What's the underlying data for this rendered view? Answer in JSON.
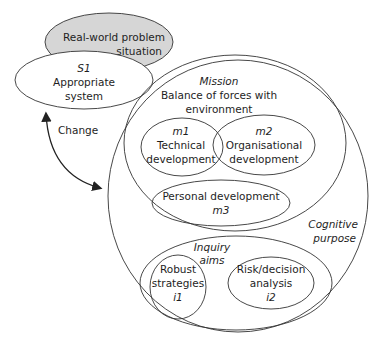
{
  "diagram": {
    "problem_situation": {
      "line1": "Real-world problem",
      "line2": "situation",
      "fill": "#d6d6d6"
    },
    "s1": {
      "code": "S1",
      "line1": "Appropriate",
      "line2": "system"
    },
    "arrow": {
      "label": "Change"
    },
    "outer_circle": {
      "label_line1": "Cognitive",
      "label_line2": "purpose"
    },
    "mission": {
      "title": "Mission",
      "line1": "Balance of forces with",
      "line2": "environment",
      "m1": {
        "code": "m1",
        "line1": "Technical",
        "line2": "development"
      },
      "m2": {
        "code": "m2",
        "line1": "Organisational",
        "line2": "development"
      },
      "m3": {
        "code": "m3",
        "line1": "Personal development"
      }
    },
    "inquiry": {
      "title_line1": "Inquiry",
      "title_line2": "aims",
      "i1": {
        "line1": "Robust",
        "line2": "strategies",
        "code": "i1"
      },
      "i2": {
        "line1": "Risk/decision",
        "line2": "analysis",
        "code": "i2"
      }
    }
  }
}
